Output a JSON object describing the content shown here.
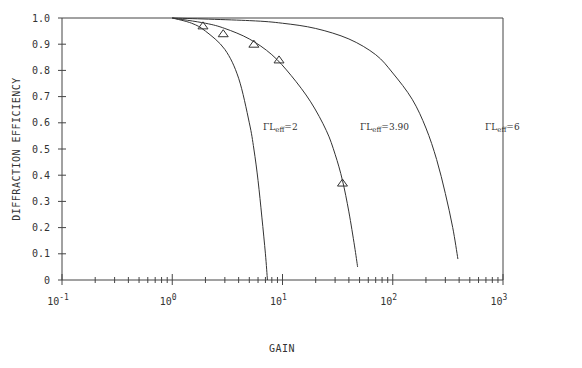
{
  "chart_data": {
    "type": "line",
    "title": "",
    "xlabel": "GAIN",
    "ylabel": "DIFFRACTION EFFICIENCY",
    "xscale": "log",
    "xlim": [
      0.1,
      1000
    ],
    "ylim": [
      0,
      1.0
    ],
    "x_tick_labels": [
      {
        "base": "10",
        "exp": "-1"
      },
      {
        "base": "10",
        "exp": "0"
      },
      {
        "base": "10",
        "exp": "1"
      },
      {
        "base": "10",
        "exp": "2"
      },
      {
        "base": "10",
        "exp": "3"
      }
    ],
    "y_tick_labels": [
      "0",
      "0.1",
      "0.2",
      "0.3",
      "0.4",
      "0.5",
      "0.6",
      "0.7",
      "0.8",
      "0.9",
      "1.0"
    ],
    "grid": false,
    "legend": "inline curve labels",
    "series": [
      {
        "name": "ΓLeff=2",
        "label_main": "ΓL",
        "label_sub": "eff",
        "label_val": "=2",
        "points": [
          [
            1.0,
            1.0
          ],
          [
            1.5,
            0.98
          ],
          [
            2,
            0.95
          ],
          [
            3,
            0.88
          ],
          [
            4,
            0.77
          ],
          [
            5,
            0.6
          ],
          [
            5.5,
            0.5
          ],
          [
            6,
            0.38
          ],
          [
            6.5,
            0.24
          ],
          [
            7,
            0.1
          ],
          [
            7.3,
            0.0
          ]
        ]
      },
      {
        "name": "ΓLeff=3.90",
        "label_main": "ΓL",
        "label_sub": "eff",
        "label_val": "=3.90",
        "points": [
          [
            1.0,
            1.0
          ],
          [
            2,
            0.98
          ],
          [
            3,
            0.96
          ],
          [
            5,
            0.92
          ],
          [
            8,
            0.86
          ],
          [
            12,
            0.78
          ],
          [
            18,
            0.68
          ],
          [
            25,
            0.57
          ],
          [
            30,
            0.48
          ],
          [
            35,
            0.38
          ],
          [
            40,
            0.26
          ],
          [
            45,
            0.13
          ],
          [
            48,
            0.05
          ]
        ]
      },
      {
        "name": "ΓLeff=6",
        "label_main": "ΓL",
        "label_sub": "eff",
        "label_val": "=6",
        "points": [
          [
            1.0,
            1.0
          ],
          [
            5,
            0.99
          ],
          [
            10,
            0.98
          ],
          [
            20,
            0.96
          ],
          [
            40,
            0.92
          ],
          [
            70,
            0.86
          ],
          [
            100,
            0.79
          ],
          [
            150,
            0.69
          ],
          [
            200,
            0.58
          ],
          [
            250,
            0.46
          ],
          [
            300,
            0.33
          ],
          [
            350,
            0.2
          ],
          [
            390,
            0.08
          ]
        ]
      }
    ],
    "markers": {
      "shape": "triangle",
      "name": "experimental data",
      "points": [
        [
          1.9,
          0.97
        ],
        [
          2.9,
          0.94
        ],
        [
          5.5,
          0.9
        ],
        [
          9.3,
          0.84
        ],
        [
          35,
          0.37
        ]
      ]
    }
  }
}
